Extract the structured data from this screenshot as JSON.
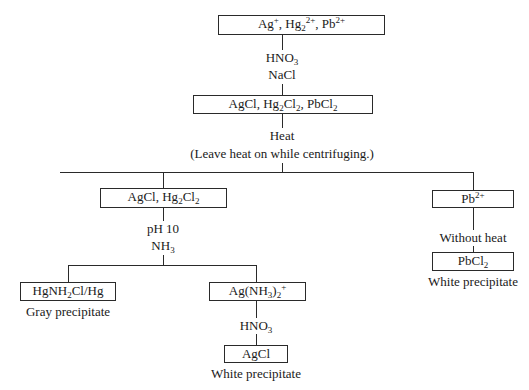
{
  "diagram": {
    "type": "flowchart",
    "nodes": {
      "start": {
        "parts": [
          "Ag",
          "+",
          ", Hg",
          "2",
          "2+",
          ", Pb",
          "2+"
        ],
        "text": "Ag+, Hg2 2+, Pb2+"
      },
      "step1_reagent_a": {
        "parts": [
          "HNO",
          "3"
        ],
        "text": "HNO3"
      },
      "step1_reagent_b": "NaCl",
      "chlorides": {
        "parts": [
          "AgCl, Hg",
          "2",
          "Cl",
          "2",
          ", PbCl",
          "2"
        ],
        "text": "AgCl, Hg2Cl2, PbCl2"
      },
      "step2_reagent": "Heat",
      "step2_note": "(Leave heat on while centrifuging.)",
      "left_precip": {
        "parts": [
          "AgCl, Hg",
          "2",
          "Cl",
          "2"
        ],
        "text": "AgCl, Hg2Cl2"
      },
      "step3_reagent_a": "pH 10",
      "step3_reagent_b": {
        "parts": [
          "NH",
          "3"
        ],
        "text": "NH3"
      },
      "mercury_product": {
        "parts": [
          "HgNH",
          "2",
          "Cl/Hg"
        ],
        "text": "HgNH2Cl/Hg"
      },
      "mercury_desc": "Gray precipitate",
      "silver_complex": {
        "parts": [
          "Ag(NH",
          "3",
          ")",
          "2",
          "+"
        ],
        "text": "Ag(NH3)2+"
      },
      "step4_reagent": {
        "parts": [
          "HNO",
          "3"
        ],
        "text": "HNO3"
      },
      "silver_product": "AgCl",
      "silver_desc": "White precipitate",
      "lead_ion": {
        "parts": [
          "Pb",
          "2+"
        ],
        "text": "Pb2+"
      },
      "lead_step": "Without heat",
      "lead_product": {
        "parts": [
          "PbCl",
          "2"
        ],
        "text": "PbCl2"
      },
      "lead_desc": "White precipitate"
    }
  }
}
